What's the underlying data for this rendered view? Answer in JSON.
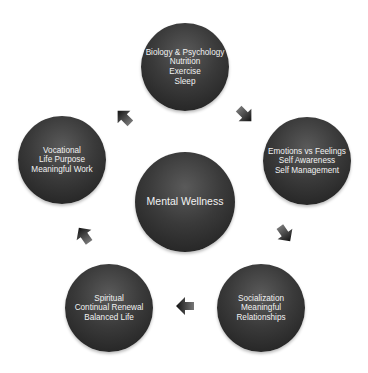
{
  "diagram": {
    "center": {
      "title": "Mental Wellness"
    },
    "nodes": [
      {
        "id": "top",
        "lines": [
          "Biology & Psychology",
          "Nutrition",
          "Exercise",
          "Sleep"
        ]
      },
      {
        "id": "right",
        "lines": [
          "Emotions vs Feelings",
          "Self Awareness",
          "Self Management"
        ]
      },
      {
        "id": "bottom-right",
        "lines": [
          "Socialization",
          "Meaningful",
          "Relationships"
        ]
      },
      {
        "id": "bottom-left",
        "lines": [
          "Spiritual",
          "Continual Renewal",
          "Balanced Life"
        ]
      },
      {
        "id": "left",
        "lines": [
          "Vocational",
          "Life Purpose",
          "Meaningful Work"
        ]
      }
    ],
    "arrows": [
      {
        "from": "top",
        "to": "right",
        "icon": "arrow-down-right-icon"
      },
      {
        "from": "right",
        "to": "bottom-right",
        "icon": "arrow-down-right-icon"
      },
      {
        "from": "bottom-right",
        "to": "bottom-left",
        "icon": "arrow-left-icon"
      },
      {
        "from": "bottom-left",
        "to": "left",
        "icon": "arrow-up-left-icon"
      },
      {
        "from": "left",
        "to": "top",
        "icon": "arrow-up-left-icon"
      }
    ],
    "colors": {
      "node_fill": "#2e2e2e",
      "node_text": "#f2f2f2",
      "arrow": "#2a2a2a",
      "background": "#ffffff"
    }
  }
}
